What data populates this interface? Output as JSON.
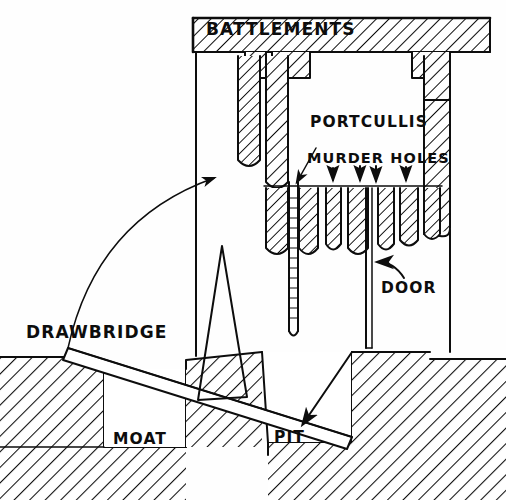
{
  "diagram": {
    "style": "hand-drawn ink sketch",
    "canvas": {
      "width": 506,
      "height": 500
    },
    "ink_color": "#0d0d0d",
    "paper_color": "#fefefe"
  },
  "labels": {
    "battlements": "BATTLEMENTS",
    "portcullis": "PORTCULLIS",
    "murder_holes": "MURDER HOLES",
    "door": "DOOR",
    "drawbridge": "DRAWBRIDGE",
    "moat": "MOAT",
    "pit": "PIT"
  },
  "annotations": {
    "arrow_to_portcullis": "arrow-right-to-portcullis",
    "arrow_portcullis_pointer": "arrow-diagonal-to-portcullis-bar",
    "arrow_door": "arrow-curved-up-left-to-door",
    "arrow_drawbridge_swing": "arc-arrow-drawbridge-raising",
    "arrow_drawbridge_drop": "arrow-down-left-into-pit",
    "murder_hole_arrows_count": 4
  },
  "features": {
    "crenellation_count": 3,
    "murder_hole_bar_count": 7,
    "portcullis_rung_count": 13,
    "ground_hatch": "diagonal-line-hatch",
    "stone_hatch": "diagonal-line-hatch"
  }
}
